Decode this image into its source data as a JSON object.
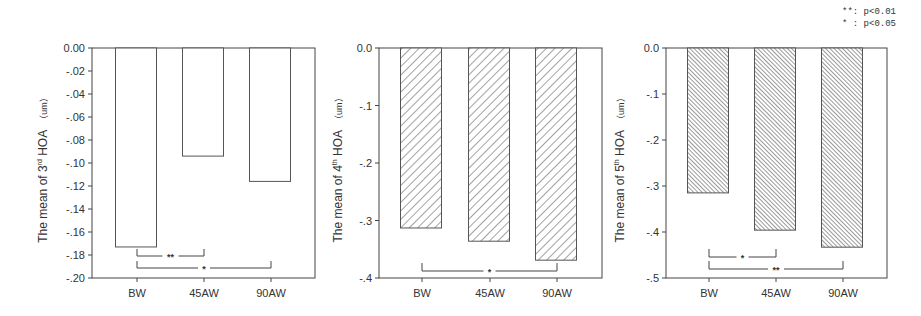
{
  "legend": {
    "items": [
      {
        "symbol": "**:",
        "text": "p<0.01"
      },
      {
        "symbol": "* :",
        "text": "p<0.05"
      }
    ]
  },
  "colors": {
    "axis": "#444444",
    "bar_edge": "#555555",
    "bar_fill": "#ffffff",
    "hatch": "#555555",
    "text": "#333333"
  },
  "chart_data": [
    {
      "type": "bar",
      "title": "",
      "xlabel": "",
      "ylabel": "The mean of 3rd HOA (um)",
      "ylabel_parts": {
        "prefix": "The mean of 3",
        "sup": "rd",
        "suffix": " HOA",
        "unit": "（um）"
      },
      "categories": [
        "BW",
        "45AW",
        "90AW"
      ],
      "values": [
        -0.173,
        -0.094,
        -0.116
      ],
      "ylim": [
        -0.2,
        0.0
      ],
      "yticks": [
        "0.00",
        "-.02",
        "-.04",
        "-.06",
        "-.08",
        "-.10",
        "-.12",
        "-.14",
        "-.16",
        "-.18",
        "-.20"
      ],
      "fill": "none",
      "significance": [
        {
          "from": "BW",
          "to": "45AW",
          "label": "**"
        },
        {
          "from": "BW",
          "to": "90AW",
          "label": "*"
        }
      ]
    },
    {
      "type": "bar",
      "title": "",
      "xlabel": "",
      "ylabel": "The mean of 4th HOA (um)",
      "ylabel_parts": {
        "prefix": "The mean of 4",
        "sup": "th",
        "suffix": " HOA",
        "unit": "（um）"
      },
      "categories": [
        "BW",
        "45AW",
        "90AW"
      ],
      "values": [
        -0.313,
        -0.336,
        -0.369
      ],
      "ylim": [
        -0.4,
        0.0
      ],
      "yticks": [
        "0.0",
        "-.1",
        "-.2",
        "-.3",
        "-.4"
      ],
      "fill": "forward-hatch",
      "significance": [
        {
          "from": "BW",
          "to": "90AW",
          "label": "*"
        }
      ]
    },
    {
      "type": "bar",
      "title": "",
      "xlabel": "",
      "ylabel": "The mean of 5th HOA (um)",
      "ylabel_parts": {
        "prefix": "The mean of 5",
        "sup": "th",
        "suffix": " HOA",
        "unit": "（um）"
      },
      "categories": [
        "BW",
        "45AW",
        "90AW"
      ],
      "values": [
        -0.315,
        -0.396,
        -0.433
      ],
      "ylim": [
        -0.5,
        0.0
      ],
      "yticks": [
        "0.0",
        "-.1",
        "-.2",
        "-.3",
        "-.4",
        "-.5"
      ],
      "fill": "back-hatch-dense",
      "significance": [
        {
          "from": "BW",
          "to": "45AW",
          "label": "*"
        },
        {
          "from": "BW",
          "to": "90AW",
          "label": "**"
        }
      ]
    }
  ]
}
